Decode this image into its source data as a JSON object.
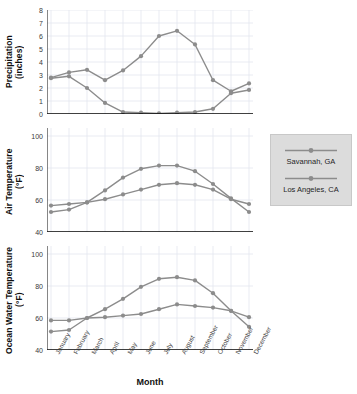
{
  "chart_data": [
    {
      "type": "line",
      "panel": "precipitation",
      "title": "",
      "xlabel": "Month",
      "ylabel": "Precipitation (inches)",
      "ylabel_lines": [
        "Precipitation",
        "(inches)"
      ],
      "categories": [
        "January",
        "February",
        "March",
        "April",
        "May",
        "June",
        "July",
        "August",
        "September",
        "October",
        "November",
        "December"
      ],
      "ylim": [
        0,
        8
      ],
      "yticks": [
        0,
        1,
        2,
        3,
        4,
        5,
        6,
        7,
        8
      ],
      "grid": true,
      "series": [
        {
          "name": "Savannah, GA",
          "color": "#8c8c8c",
          "values": [
            2.8,
            3.2,
            3.4,
            2.6,
            3.35,
            4.45,
            6.0,
            6.4,
            5.35,
            2.6,
            1.75,
            2.35
          ]
        },
        {
          "name": "Los Angeles, CA",
          "color": "#8c8c8c",
          "values": [
            2.75,
            2.9,
            2.0,
            0.85,
            0.15,
            0.1,
            0.05,
            0.1,
            0.15,
            0.4,
            1.6,
            1.85
          ]
        }
      ]
    },
    {
      "type": "line",
      "panel": "air-temperature",
      "title": "",
      "xlabel": "Month",
      "ylabel": "Air Temperature (°F)",
      "ylabel_lines": [
        "Air Temperature",
        "(°F)"
      ],
      "categories": [
        "January",
        "February",
        "March",
        "April",
        "May",
        "June",
        "July",
        "August",
        "September",
        "October",
        "November",
        "December"
      ],
      "ylim": [
        40,
        105
      ],
      "yticks": [
        40,
        60,
        80,
        100
      ],
      "grid": true,
      "series": [
        {
          "name": "Savannah, GA",
          "color": "#8c8c8c",
          "values": [
            52.5,
            54,
            58.5,
            66,
            74,
            79.5,
            81.5,
            81.5,
            78,
            70,
            61,
            52.5
          ]
        },
        {
          "name": "Los Angeles, CA",
          "color": "#8c8c8c",
          "values": [
            56.5,
            57.5,
            58.5,
            60.5,
            63.5,
            66.5,
            69.5,
            70.5,
            69.5,
            66.5,
            60.5,
            57.5
          ]
        }
      ]
    },
    {
      "type": "line",
      "panel": "ocean-water-temperature",
      "title": "",
      "xlabel": "Month",
      "ylabel": "Ocean Water Temperature (°F)",
      "ylabel_lines": [
        "Ocean Water Temperature",
        "(°F)"
      ],
      "categories": [
        "January",
        "February",
        "March",
        "April",
        "May",
        "June",
        "July",
        "August",
        "September",
        "October",
        "November",
        "December"
      ],
      "ylim": [
        40,
        105
      ],
      "yticks": [
        40,
        60,
        80,
        100
      ],
      "grid": true,
      "series": [
        {
          "name": "Savannah, GA",
          "color": "#8c8c8c",
          "values": [
            51.5,
            52.5,
            60,
            65.5,
            72,
            79.5,
            84.5,
            85.5,
            83.5,
            75.5,
            64.5,
            54.5
          ]
        },
        {
          "name": "Los Angeles, CA",
          "color": "#8c8c8c",
          "values": [
            58.5,
            58.5,
            60,
            60.5,
            61.5,
            62.5,
            65.5,
            68.5,
            67.5,
            66.5,
            64.5,
            60.5
          ]
        }
      ]
    }
  ],
  "axis": {
    "x_title": "Month",
    "categories": [
      "January",
      "February",
      "March",
      "April",
      "May",
      "June",
      "July",
      "August",
      "September",
      "October",
      "November",
      "December"
    ]
  },
  "legend": {
    "position": "right",
    "background": "#dcdcdc",
    "entries": [
      {
        "label": "Savannah, GA",
        "color": "#8c8c8c"
      },
      {
        "label": "Los Angeles, CA",
        "color": "#8c8c8c"
      }
    ]
  }
}
